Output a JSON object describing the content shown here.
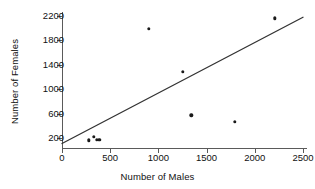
{
  "chart_data": {
    "type": "scatter",
    "title": "",
    "xlabel": "Number of Males",
    "ylabel": "Number of Females",
    "xlim": [
      0,
      2500
    ],
    "ylim": [
      110,
      2280
    ],
    "grid": false,
    "legend": null,
    "xticks": [
      0,
      500,
      1000,
      1500,
      2000,
      2500
    ],
    "xtick_labels": [
      "0",
      "500",
      "1000",
      "1500",
      "2000",
      "2500"
    ],
    "yticks": [
      200,
      600,
      1000,
      1400,
      1800,
      2200
    ],
    "ytick_labels": [
      "200",
      "600",
      "1000",
      "1400",
      "1800",
      "2200"
    ],
    "points": [
      {
        "x": 280,
        "y": 160
      },
      {
        "x": 330,
        "y": 215
      },
      {
        "x": 360,
        "y": 175
      },
      {
        "x": 385,
        "y": 170
      },
      {
        "x": 900,
        "y": 1990
      },
      {
        "x": 1250,
        "y": 1290
      },
      {
        "x": 1340,
        "y": 570
      },
      {
        "x": 1790,
        "y": 470
      },
      {
        "x": 2210,
        "y": 2160
      }
    ],
    "trend_line": {
      "x0": 0,
      "y0": 110,
      "x1": 2500,
      "y1": 2180
    },
    "colors": {
      "point": "#1a1a1a",
      "line": "#333333",
      "axis": "#5a5a5a",
      "text": "#111111",
      "background": "#ffffff"
    }
  }
}
